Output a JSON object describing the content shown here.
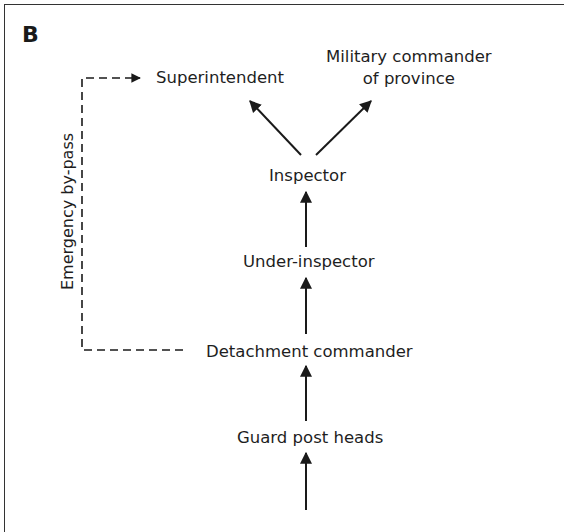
{
  "panel": {
    "label": "B"
  },
  "nodes": {
    "superintendent": "Superintendent",
    "military_commander_line1": "Military commander",
    "military_commander_line2": "of province",
    "inspector": "Inspector",
    "under_inspector": "Under-inspector",
    "detachment_commander": "Detachment commander",
    "guard_post_heads": "Guard post heads"
  },
  "bypass": {
    "label": "Emergency by-pass",
    "style": "dashed"
  },
  "edges": [
    {
      "from": "Inspector",
      "to": "Superintendent",
      "style": "solid"
    },
    {
      "from": "Inspector",
      "to": "Military commander of province",
      "style": "solid"
    },
    {
      "from": "Under-inspector",
      "to": "Inspector",
      "style": "solid"
    },
    {
      "from": "Detachment commander",
      "to": "Under-inspector",
      "style": "solid"
    },
    {
      "from": "Guard post heads",
      "to": "Detachment commander",
      "style": "solid"
    },
    {
      "from": "(below)",
      "to": "Guard post heads",
      "style": "solid"
    },
    {
      "from": "Detachment commander",
      "to": "Superintendent",
      "style": "dashed",
      "label": "Emergency by-pass"
    }
  ],
  "colors": {
    "line": "#1a1a1a",
    "frame": "#333333",
    "background": "#ffffff"
  }
}
